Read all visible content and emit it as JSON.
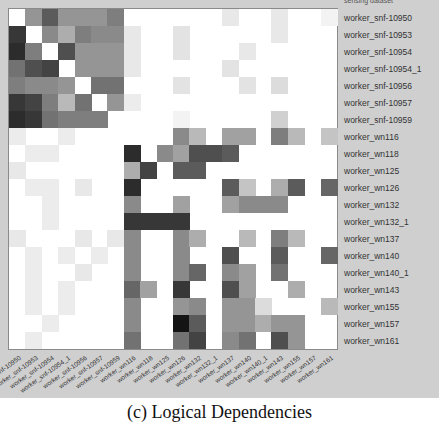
{
  "chart_data": {
    "type": "heatmap",
    "title": "",
    "caption": "(c) Logical Dependencies",
    "colormap": "grayscale (white=0, black=1)",
    "top_clipped_label": "sensing dataset",
    "rows": [
      "worker_snf-10950",
      "worker_snf-10953",
      "worker_snf-10954",
      "worker_snf-10954_1",
      "worker_snf-10956",
      "worker_snf-10957",
      "worker_snf-10959",
      "worker_wn116",
      "worker_wn118",
      "worker_wn125",
      "worker_wn126",
      "worker_wn132",
      "worker_wn132_1",
      "worker_wn137",
      "worker_wn140",
      "worker_wn140_1",
      "worker_wn143",
      "worker_wn155",
      "worker_wn157",
      "worker_wn161"
    ],
    "columns": [
      "worker_snf-10950",
      "worker_snf-10953",
      "worker_snf-10954",
      "worker_snf-10954_1",
      "worker_snf-10956",
      "worker_snf-10957",
      "worker_snf-10959",
      "worker_wn116",
      "worker_wn118",
      "worker_wn125",
      "worker_wn126",
      "worker_wn132",
      "worker_wn132_1",
      "worker_wn137",
      "worker_wn140",
      "worker_wn140_1",
      "worker_wn143",
      "worker_wn155",
      "worker_wn157",
      "worker_wn161"
    ],
    "values": [
      [
        0,
        0.45,
        0.7,
        0.45,
        0.45,
        0.45,
        0.55,
        0,
        0,
        0,
        0,
        0,
        0,
        0.1,
        0,
        0,
        0.1,
        0,
        0,
        0.05
      ],
      [
        0.85,
        0,
        0.5,
        0.35,
        0.55,
        0.5,
        0.5,
        0.1,
        0,
        0,
        0.12,
        0,
        0,
        0,
        0,
        0,
        0.1,
        0,
        0,
        0
      ],
      [
        0.9,
        0.55,
        0,
        0.75,
        0.45,
        0.45,
        0.45,
        0.1,
        0,
        0,
        0.12,
        0,
        0,
        0,
        0.1,
        0,
        0,
        0,
        0,
        0
      ],
      [
        0.6,
        0.75,
        0.8,
        0,
        0.45,
        0.45,
        0.45,
        0.1,
        0,
        0,
        0,
        0,
        0,
        0.12,
        0,
        0,
        0,
        0,
        0,
        0
      ],
      [
        0.55,
        0.5,
        0.5,
        0.45,
        0,
        0.6,
        0.6,
        0,
        0,
        0,
        0.12,
        0,
        0,
        0,
        0.12,
        0,
        0.15,
        0,
        0,
        0
      ],
      [
        0.85,
        0.8,
        0.55,
        0.3,
        0.6,
        0,
        0.45,
        0.08,
        0,
        0,
        0,
        0,
        0,
        0,
        0,
        0,
        0,
        0,
        0,
        0
      ],
      [
        0.9,
        0.85,
        0.6,
        0.55,
        0.55,
        0.55,
        0,
        0,
        0,
        0,
        0.05,
        0,
        0,
        0,
        0,
        0,
        0.2,
        0,
        0,
        0
      ],
      [
        0.08,
        0,
        0,
        0.08,
        0,
        0,
        0,
        0,
        0,
        0,
        0.5,
        0.3,
        0,
        0.4,
        0.4,
        0,
        0.55,
        0.3,
        0,
        0.25
      ],
      [
        0,
        0.08,
        0.08,
        0,
        0,
        0,
        0,
        0.9,
        0,
        0.5,
        0.4,
        0.75,
        0.75,
        0.7,
        0,
        0,
        0,
        0,
        0,
        0
      ],
      [
        0.1,
        0,
        0,
        0,
        0,
        0,
        0,
        0.35,
        0.8,
        0,
        0.7,
        0.7,
        0,
        0,
        0,
        0,
        0,
        0,
        0,
        0
      ],
      [
        0,
        0.08,
        0.08,
        0,
        0.1,
        0,
        0,
        0.9,
        0,
        0,
        0,
        0,
        0,
        0.7,
        0.25,
        0,
        0.35,
        0.7,
        0,
        0.65
      ],
      [
        0,
        0,
        0.08,
        0,
        0,
        0,
        0,
        0.5,
        0,
        0,
        0.4,
        0,
        0,
        0.4,
        0.5,
        0.5,
        0.5,
        0,
        0,
        0
      ],
      [
        0,
        0,
        0.08,
        0,
        0,
        0,
        0,
        0.85,
        0.85,
        0.85,
        0.85,
        0,
        0,
        0,
        0,
        0,
        0,
        0,
        0,
        0
      ],
      [
        0.1,
        0,
        0,
        0,
        0.1,
        0,
        0.1,
        0.5,
        0,
        0,
        0.5,
        0.35,
        0,
        0,
        0.3,
        0,
        0.55,
        0.3,
        0,
        0
      ],
      [
        0,
        0.08,
        0,
        0.08,
        0,
        0.08,
        0,
        0.5,
        0,
        0,
        0.5,
        0,
        0,
        0.75,
        0,
        0,
        0.7,
        0,
        0,
        0.65
      ],
      [
        0,
        0.08,
        0,
        0,
        0.1,
        0,
        0,
        0.5,
        0,
        0,
        0.5,
        0.65,
        0,
        0.5,
        0.4,
        0,
        0.6,
        0,
        0,
        0
      ],
      [
        0,
        0.08,
        0,
        0.08,
        0,
        0,
        0,
        0.65,
        0.4,
        0,
        0.85,
        0,
        0,
        0.75,
        0.4,
        0,
        0,
        0.35,
        0,
        0
      ],
      [
        0,
        0.08,
        0,
        0.08,
        0,
        0,
        0,
        0.5,
        0,
        0,
        0.45,
        0.5,
        0,
        0.45,
        0.45,
        0.15,
        0,
        0,
        0,
        0.3
      ],
      [
        0,
        0,
        0.08,
        0,
        0,
        0,
        0,
        0.5,
        0,
        0,
        1.0,
        0.7,
        0,
        0.45,
        0.45,
        0.35,
        0.45,
        0.45,
        0,
        0
      ],
      [
        0,
        0.08,
        0,
        0,
        0,
        0,
        0,
        0.6,
        0,
        0,
        0.6,
        0.8,
        0,
        0.5,
        0.6,
        0,
        0.75,
        0.45,
        0,
        0
      ]
    ],
    "xlabel": "",
    "ylabel": "",
    "legend": "none",
    "grid": false
  }
}
